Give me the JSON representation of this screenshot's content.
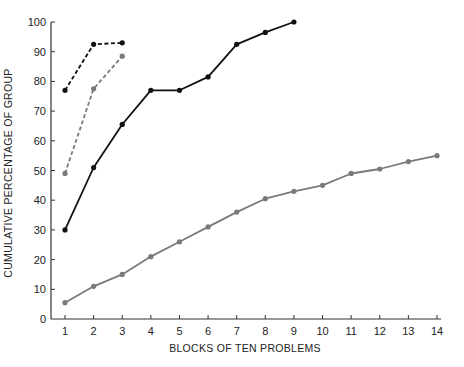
{
  "chart_data": {
    "type": "line",
    "title": "",
    "xlabel": "BLOCKS OF TEN PROBLEMS",
    "ylabel": "CUMULATIVE  PERCENTAGE OF GROUP",
    "xlim": [
      1,
      14
    ],
    "ylim": [
      0,
      100
    ],
    "x_ticks": [
      1,
      2,
      3,
      4,
      5,
      6,
      7,
      8,
      9,
      10,
      11,
      12,
      13,
      14
    ],
    "y_ticks": [
      0,
      10,
      20,
      30,
      40,
      50,
      60,
      70,
      80,
      90,
      100
    ],
    "grid": false,
    "legend": null,
    "series": [
      {
        "name": "black-dashed",
        "color": "#111111",
        "style": "dashed",
        "x": [
          1,
          2,
          3
        ],
        "values": [
          77,
          92.5,
          93
        ]
      },
      {
        "name": "gray-dashed",
        "color": "#7a7a7a",
        "style": "dashed",
        "x": [
          1,
          2,
          3
        ],
        "values": [
          49,
          77.5,
          88.5
        ]
      },
      {
        "name": "black-solid",
        "color": "#111111",
        "style": "solid",
        "x": [
          1,
          2,
          3,
          4,
          5,
          6,
          7,
          8,
          9
        ],
        "values": [
          30,
          51,
          65.5,
          77,
          77,
          81.5,
          92.5,
          96.5,
          100
        ]
      },
      {
        "name": "gray-solid",
        "color": "#7a7a7a",
        "style": "solid",
        "x": [
          1,
          2,
          3,
          4,
          5,
          6,
          7,
          8,
          9,
          10,
          11,
          12,
          13,
          14
        ],
        "values": [
          5.5,
          11,
          15,
          21,
          26,
          31,
          36,
          40.5,
          43,
          45,
          49,
          50.5,
          53,
          55
        ]
      }
    ]
  }
}
